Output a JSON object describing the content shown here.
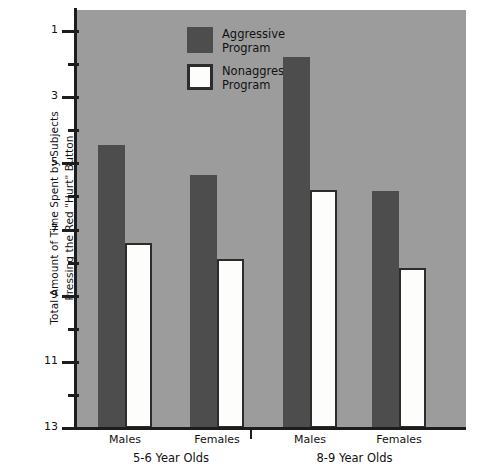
{
  "chart_data": {
    "type": "bar",
    "title": "",
    "subtitle": "",
    "xlabel": "",
    "ylabel": "Total Amount of Time Spent by Subjects Pressing the Red \"Hurt\" Button",
    "ylabel_lines": [
      "Total Amount of Time Spent by Subjects",
      "Pressing the Red \"Hurt\" Button"
    ],
    "ylim": [
      1,
      13.6
    ],
    "y_major_ticks": [
      1,
      3,
      5,
      7,
      9,
      11,
      13
    ],
    "y_major_tick_labels": [
      "1",
      "3",
      "5",
      "7",
      "9",
      "11",
      "13"
    ],
    "y_minor_ticks": [
      2,
      4,
      6,
      8,
      10,
      12
    ],
    "grid": false,
    "legend_position": "top-left",
    "categories": [
      "Males",
      "Females",
      "Males",
      "Females"
    ],
    "groups": [
      {
        "label": "5-6 Year Olds",
        "categories": [
          "Males",
          "Females"
        ]
      },
      {
        "label": "8-9 Year Olds",
        "categories": [
          "Males",
          "Females"
        ]
      }
    ],
    "series": [
      {
        "name": "Aggressive Program",
        "color": "#4d4d4d",
        "values": [
          9.55,
          8.65,
          12.2,
          8.15
        ]
      },
      {
        "name": "Nonaggressive Program",
        "color": "#fdfdfb",
        "border_color": "#2c2c2c",
        "values": [
          6.6,
          6.1,
          8.2,
          5.85
        ]
      }
    ],
    "bars": [
      {
        "group": "5-6 Year Olds",
        "category": "Males",
        "series": "Aggressive Program",
        "value": 9.55
      },
      {
        "group": "5-6 Year Olds",
        "category": "Males",
        "series": "Nonaggressive Program",
        "value": 6.6
      },
      {
        "group": "5-6 Year Olds",
        "category": "Females",
        "series": "Aggressive Program",
        "value": 8.65
      },
      {
        "group": "5-6 Year Olds",
        "category": "Females",
        "series": "Nonaggressive Program",
        "value": 6.1
      },
      {
        "group": "8-9 Year Olds",
        "category": "Males",
        "series": "Aggressive Program",
        "value": 12.2
      },
      {
        "group": "8-9 Year Olds",
        "category": "Males",
        "series": "Nonaggressive Program",
        "value": 8.2
      },
      {
        "group": "8-9 Year Olds",
        "category": "Females",
        "series": "Aggressive Program",
        "value": 8.15
      },
      {
        "group": "8-9 Year Olds",
        "category": "Females",
        "series": "Nonaggressive Program",
        "value": 5.85
      }
    ],
    "colors": {
      "plot_background": "#9c9c9c",
      "page_background": "#ffffff",
      "axis": "#1d1d1d",
      "aggressive": "#4d4d4d",
      "nonaggressive_fill": "#fdfdfb",
      "nonaggressive_border": "#2c2c2c",
      "text": "#111111"
    }
  },
  "legend": {
    "entries": [
      {
        "label_line1": "Aggressive",
        "label_line2": "Program",
        "swatch": "filled-dark-square"
      },
      {
        "label_line1": "Nonaggressive",
        "label_line2": "Program",
        "swatch": "outlined-white-square"
      }
    ]
  },
  "y_axis": {
    "labels": [
      "13",
      "11",
      "9",
      "7",
      "5",
      "3",
      "1"
    ]
  },
  "x_axis": {
    "sublabels": [
      "Males",
      "Females",
      "Males",
      "Females"
    ],
    "group_labels": [
      "5-6 Year Olds",
      "8-9 Year Olds"
    ]
  }
}
